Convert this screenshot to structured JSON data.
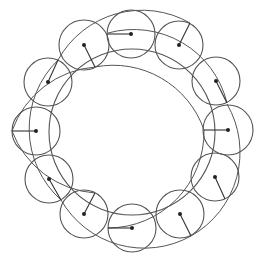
{
  "diagram": {
    "colors": {
      "stroke": "#555555",
      "dot": "#222222",
      "background": "#ffffff"
    },
    "inner_circle": {
      "cx": 132,
      "cy": 132,
      "r": 83
    },
    "ring_circles": [
      {
        "name": "left",
        "cx": 36,
        "cy": 131,
        "r": 24,
        "radius_end": [
          12,
          131
        ]
      },
      {
        "name": "upper-left",
        "cx": 48,
        "cy": 82,
        "r": 24,
        "radius_end": [
          58,
          60
        ]
      },
      {
        "name": "top-left",
        "cx": 84,
        "cy": 45,
        "r": 25,
        "radius_end": [
          95,
          67
        ]
      },
      {
        "name": "top",
        "cx": 131,
        "cy": 34,
        "r": 24,
        "radius_end": [
          107,
          34
        ]
      },
      {
        "name": "top-right",
        "cx": 179,
        "cy": 45,
        "r": 24,
        "radius_end": [
          190,
          23
        ]
      },
      {
        "name": "upper-right",
        "cx": 216,
        "cy": 81,
        "r": 24,
        "radius_end": [
          227,
          103
        ]
      },
      {
        "name": "right",
        "cx": 228,
        "cy": 130,
        "r": 25,
        "radius_end": [
          204,
          130
        ]
      },
      {
        "name": "lower-right",
        "cx": 215,
        "cy": 177,
        "r": 24,
        "radius_end": [
          225,
          199
        ]
      },
      {
        "name": "bottom-right",
        "cx": 180,
        "cy": 214,
        "r": 24,
        "radius_end": [
          191,
          236
        ]
      },
      {
        "name": "bottom",
        "cx": 132,
        "cy": 228,
        "r": 24,
        "radius_end": [
          108,
          228
        ]
      },
      {
        "name": "bottom-left",
        "cx": 84,
        "cy": 214,
        "r": 24,
        "radius_end": [
          95,
          193
        ]
      },
      {
        "name": "lower-left",
        "cx": 49,
        "cy": 179,
        "r": 24,
        "radius_end": [
          61,
          200
        ]
      }
    ],
    "envelope_arcs": [
      {
        "name": "arc-top-right",
        "d": "M 108 33 A 96 96 0 0 1 227 103"
      },
      {
        "name": "arc-right-bottom",
        "d": "M 227 104 A 96 96 0 0 1 191 236"
      },
      {
        "name": "arc-bottom",
        "d": "M 204 130 A 96 96 0 0 1 108 228"
      },
      {
        "name": "arc-bottom-left",
        "d": "M 191 236 A 96 96 0 0 1 61 200"
      },
      {
        "name": "arc-left-lower",
        "d": "M 95 193 A 96 96 0 0 1 12 131"
      },
      {
        "name": "arc-left-upper",
        "d": "M 61 200 A 96 96 0 0 1 58 60"
      },
      {
        "name": "arc-left-top",
        "d": "M 12 131 A 96 96 0 0 1 95 67"
      },
      {
        "name": "arc-top-left",
        "d": "M 58 60 A 96 96 0 0 1 190 23"
      },
      {
        "name": "arc-top",
        "d": "M 95 67 A 96 96 0 0 1 204 130"
      }
    ]
  }
}
